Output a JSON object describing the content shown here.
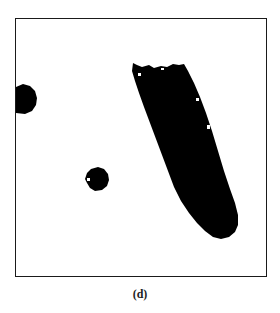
{
  "figure": {
    "caption": "(d)",
    "colors": {
      "foreground": "#000000",
      "background": "#ffffff",
      "border": "#1a1a1a"
    },
    "blobs": [
      {
        "name": "left-edge-blob",
        "approx_center": [
          25,
          98
        ],
        "approx_size": [
          22,
          30
        ]
      },
      {
        "name": "small-round-blob",
        "approx_center": [
          96,
          178
        ],
        "approx_size": [
          24,
          24
        ]
      },
      {
        "name": "large-elongated-blob",
        "approx_center": [
          180,
          150
        ],
        "approx_size": [
          90,
          175
        ]
      }
    ]
  }
}
